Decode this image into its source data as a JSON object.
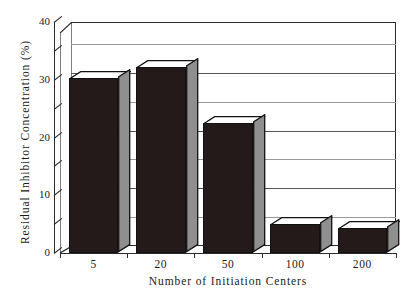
{
  "chart_data": {
    "type": "bar",
    "title": "",
    "xlabel": "Number of Initiation Centers",
    "ylabel": "Residual Inhibitor Concentration (%)",
    "categories": [
      "5",
      "20",
      "50",
      "100",
      "200"
    ],
    "values": [
      30.3,
      32.2,
      22.5,
      5.0,
      4.3
    ],
    "ylim": [
      0,
      40
    ],
    "yticks": [
      0,
      10,
      20,
      30,
      40
    ],
    "ytick_labels": [
      "0",
      "10",
      "20",
      "30",
      "40"
    ],
    "yticks_minor": [
      5,
      15,
      25,
      35
    ],
    "gridlines": [
      5,
      10,
      15,
      20,
      25,
      30,
      35
    ],
    "grid": true,
    "legend": "none",
    "style": "3d-bar",
    "bar_color": "#241a1a",
    "bar_top_color": "#ffffff",
    "bar_side_color": "#8f8f8f",
    "axis_color": "#2b2b2b",
    "grid_color": "#555555",
    "background": "#ffffff"
  },
  "axes": {
    "y_title": "Residual Inhibitor Concentration (%)",
    "x_title": "Number of Initiation Centers"
  }
}
